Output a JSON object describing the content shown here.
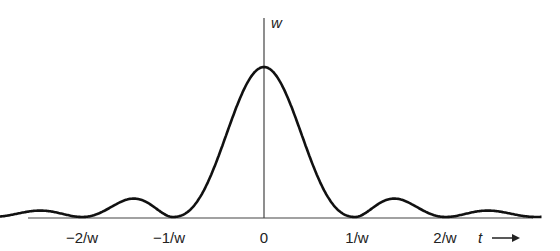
{
  "chart_data": {
    "type": "line",
    "title": "",
    "xlabel": "t",
    "ylabel": "w",
    "function": "w * sinc^2(w t) style pulse spectrum",
    "x_ticks": [
      "-2/w",
      "-1/w",
      "0",
      "1/w",
      "2/w"
    ],
    "x_tick_values": [
      -2,
      -1,
      0,
      1,
      2
    ],
    "y_peak_label": "w",
    "peak_value": 1.0,
    "zeros": [
      -3,
      -2,
      -1,
      1,
      2,
      3
    ],
    "xlim": [
      -3.05,
      3.05
    ],
    "ylim": [
      0,
      1.3
    ],
    "grid": false,
    "legend": null,
    "series": [
      {
        "name": "w",
        "x": [
          -3,
          -2.5,
          -2,
          -1.5,
          -1,
          -0.5,
          0,
          0.5,
          1,
          1.5,
          2,
          2.5,
          3
        ],
        "values": [
          0,
          0.12,
          0,
          0.15,
          0,
          0.55,
          1.0,
          0.55,
          0,
          0.15,
          0,
          0.12,
          0
        ]
      }
    ]
  },
  "labels": {
    "y_axis": "w",
    "x_axis": "t",
    "arrow": "→",
    "ticks": {
      "neg2": "−2/w",
      "neg1": "−1/w",
      "zero": "0",
      "pos1": "1/w",
      "pos2": "2/w"
    }
  }
}
